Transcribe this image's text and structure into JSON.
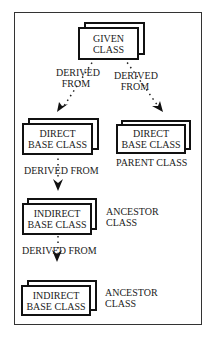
{
  "diagram": {
    "nodes": {
      "given": {
        "line1": "GIVEN",
        "line2": "CLASS"
      },
      "direct_left": {
        "line1": "DIRECT",
        "line2": "BASE CLASS"
      },
      "direct_right": {
        "line1": "DIRECT",
        "line2": "BASE CLASS"
      },
      "indirect_1": {
        "line1": "INDIRECT",
        "line2": "BASE CLASS"
      },
      "indirect_2": {
        "line1": "INDIRECT",
        "line2": "BASE CLASS"
      }
    },
    "edge_labels": {
      "left_line1": "DERIVED",
      "left_line2": "FROM",
      "right_line1": "DERIVED",
      "right_line2": "FROM",
      "mid1": "DERIVED FROM",
      "mid2": "DERIVED FROM"
    },
    "annotations": {
      "parent": "PARENT CLASS",
      "ancestor1_line1": "ANCESTOR",
      "ancestor1_line2": "CLASS",
      "ancestor2_line1": "ANCESTOR",
      "ancestor2_line2": "CLASS"
    }
  }
}
